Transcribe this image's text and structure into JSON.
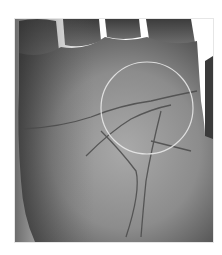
{
  "image": {
    "subject": "grayscale photograph of an open palm showing palm lines",
    "overlay": {
      "shape": "circle",
      "color": "#e8e8e8",
      "center": [
        146,
        107
      ],
      "radius": 46
    },
    "colors": {
      "background": "#ffffff",
      "skin_dark": "#3a3a3a",
      "skin_mid": "#7a7a7a",
      "skin_light": "#a8a8a8",
      "crease": "#4a4a4a"
    }
  }
}
